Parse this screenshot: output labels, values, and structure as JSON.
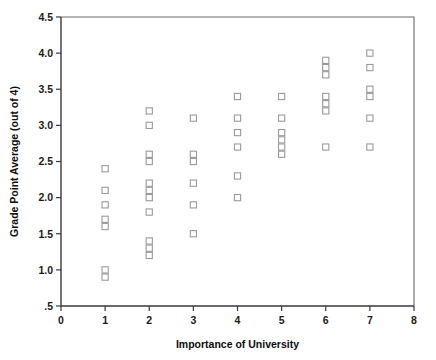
{
  "chart_data": {
    "type": "scatter",
    "title": "",
    "xlabel": "Importance of University",
    "ylabel": "Grade Point Average (out of 4)",
    "xlim": [
      0,
      8
    ],
    "ylim": [
      0.5,
      4.5
    ],
    "xticks": [
      "0",
      "1",
      "2",
      "3",
      "4",
      "5",
      "6",
      "7",
      "8"
    ],
    "xtick_values": [
      0,
      1,
      2,
      3,
      4,
      5,
      6,
      7,
      8
    ],
    "yticks": [
      ".5",
      "1.0",
      "1.5",
      "2.0",
      "2.5",
      "3.0",
      "3.5",
      "4.0",
      "4.5"
    ],
    "ytick_values": [
      0.5,
      1.0,
      1.5,
      2.0,
      2.5,
      3.0,
      3.5,
      4.0,
      4.5
    ],
    "grid": false,
    "legend": false,
    "marker_style": "open-square",
    "marker_color": "#9a9a9a",
    "points": [
      {
        "x": 1,
        "y": 2.4
      },
      {
        "x": 1,
        "y": 2.1
      },
      {
        "x": 1,
        "y": 1.9
      },
      {
        "x": 1,
        "y": 1.7
      },
      {
        "x": 1,
        "y": 1.6
      },
      {
        "x": 1,
        "y": 1.0
      },
      {
        "x": 1,
        "y": 0.9
      },
      {
        "x": 2,
        "y": 3.2
      },
      {
        "x": 2,
        "y": 3.0
      },
      {
        "x": 2,
        "y": 2.6
      },
      {
        "x": 2,
        "y": 2.5
      },
      {
        "x": 2,
        "y": 2.2
      },
      {
        "x": 2,
        "y": 2.1
      },
      {
        "x": 2,
        "y": 2.0
      },
      {
        "x": 2,
        "y": 1.8
      },
      {
        "x": 2,
        "y": 1.4
      },
      {
        "x": 2,
        "y": 1.3
      },
      {
        "x": 2,
        "y": 1.2
      },
      {
        "x": 3,
        "y": 3.1
      },
      {
        "x": 3,
        "y": 2.6
      },
      {
        "x": 3,
        "y": 2.5
      },
      {
        "x": 3,
        "y": 2.2
      },
      {
        "x": 3,
        "y": 1.9
      },
      {
        "x": 3,
        "y": 1.5
      },
      {
        "x": 4,
        "y": 3.4
      },
      {
        "x": 4,
        "y": 3.1
      },
      {
        "x": 4,
        "y": 2.9
      },
      {
        "x": 4,
        "y": 2.7
      },
      {
        "x": 4,
        "y": 2.3
      },
      {
        "x": 4,
        "y": 2.0
      },
      {
        "x": 5,
        "y": 3.4
      },
      {
        "x": 5,
        "y": 3.1
      },
      {
        "x": 5,
        "y": 2.9
      },
      {
        "x": 5,
        "y": 2.8
      },
      {
        "x": 5,
        "y": 2.7
      },
      {
        "x": 5,
        "y": 2.6
      },
      {
        "x": 6,
        "y": 3.9
      },
      {
        "x": 6,
        "y": 3.8
      },
      {
        "x": 6,
        "y": 3.7
      },
      {
        "x": 6,
        "y": 3.4
      },
      {
        "x": 6,
        "y": 3.3
      },
      {
        "x": 6,
        "y": 3.2
      },
      {
        "x": 6,
        "y": 2.7
      },
      {
        "x": 7,
        "y": 4.0
      },
      {
        "x": 7,
        "y": 3.8
      },
      {
        "x": 7,
        "y": 3.5
      },
      {
        "x": 7,
        "y": 3.4
      },
      {
        "x": 7,
        "y": 3.1
      },
      {
        "x": 7,
        "y": 2.7
      }
    ]
  }
}
